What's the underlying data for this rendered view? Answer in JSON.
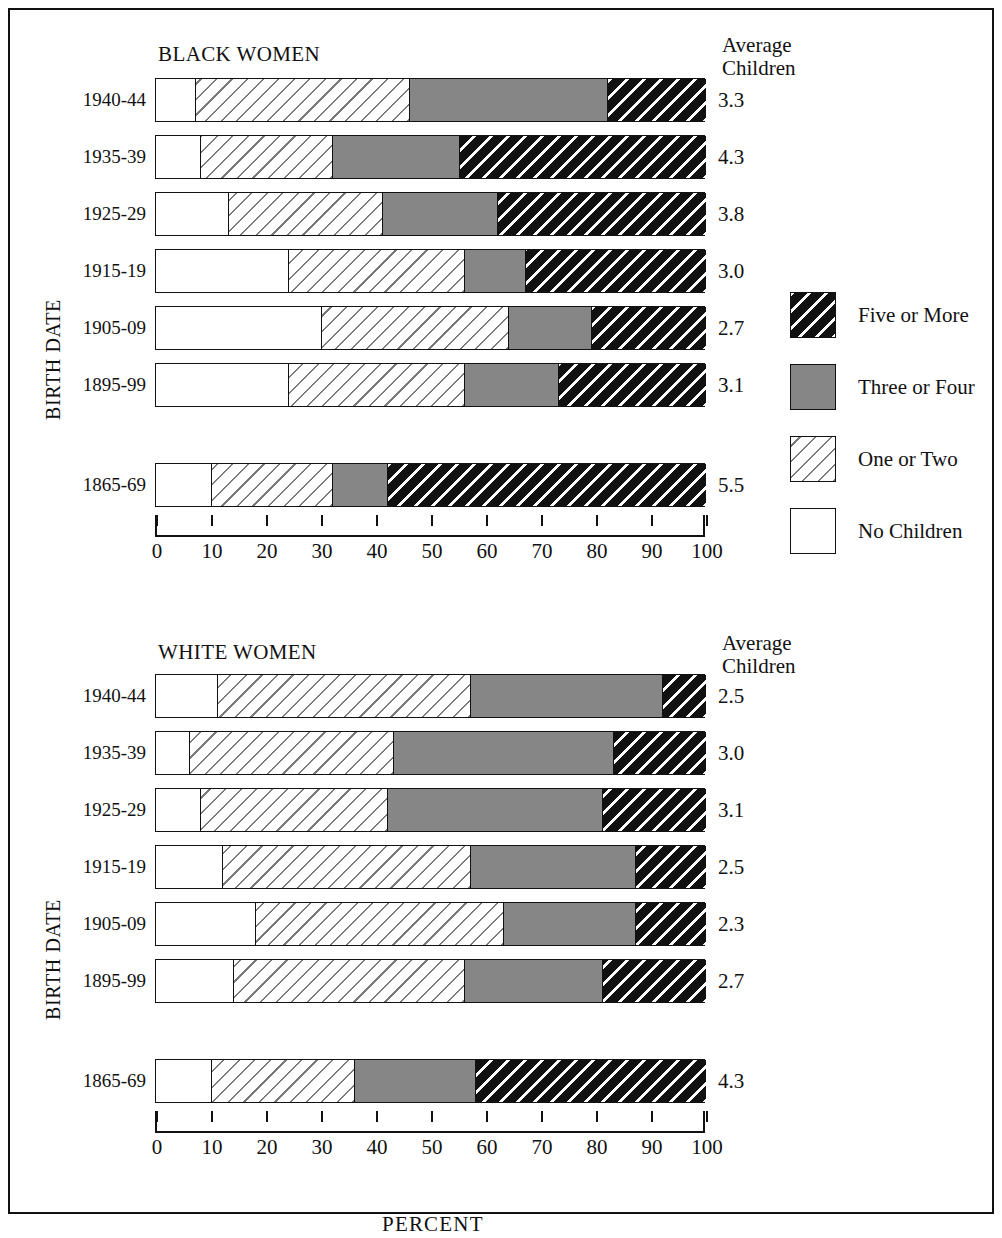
{
  "figure": {
    "axis_title": "PERCENT",
    "y_axis_title": "BIRTH DATE",
    "average_header_line1": "Average",
    "average_header_line2": "Children"
  },
  "legend": {
    "items": [
      {
        "key": "five",
        "label": "Five or More"
      },
      {
        "key": "threefour",
        "label": "Three or Four"
      },
      {
        "key": "onetwo",
        "label": "One or Two"
      },
      {
        "key": "none",
        "label": "No Children"
      }
    ]
  },
  "colors": {
    "five_or_more": "#111111",
    "three_or_four": "#868686",
    "one_or_two": "#ffffff",
    "no_children": "#ffffff",
    "outline": "#111111"
  },
  "chart_data": [
    {
      "type": "bar",
      "orientation": "horizontal",
      "stacked": true,
      "title": "BLACK WOMEN",
      "xlabel": "PERCENT",
      "ylabel": "BIRTH DATE",
      "xlim": [
        0,
        100
      ],
      "xticks": [
        0,
        10,
        20,
        30,
        40,
        50,
        60,
        70,
        80,
        90,
        100
      ],
      "grid": false,
      "legend_position": "right",
      "categories": [
        "1940-44",
        "1935-39",
        "1925-29",
        "1915-19",
        "1905-09",
        "1895-99",
        "1865-69"
      ],
      "series": [
        {
          "name": "No Children",
          "values": [
            7,
            8,
            13,
            24,
            30,
            24,
            10
          ]
        },
        {
          "name": "One or Two",
          "values": [
            39,
            24,
            28,
            32,
            34,
            32,
            22
          ]
        },
        {
          "name": "Three or Four",
          "values": [
            36,
            23,
            21,
            11,
            15,
            17,
            10
          ]
        },
        {
          "name": "Five or More",
          "values": [
            18,
            45,
            38,
            33,
            21,
            27,
            58
          ]
        }
      ],
      "annotations": {
        "header": "Average Children",
        "values": [
          "3.3",
          "4.3",
          "3.8",
          "3.0",
          "2.7",
          "3.1",
          "5.5"
        ]
      }
    },
    {
      "type": "bar",
      "orientation": "horizontal",
      "stacked": true,
      "title": "WHITE WOMEN",
      "xlabel": "PERCENT",
      "ylabel": "BIRTH DATE",
      "xlim": [
        0,
        100
      ],
      "xticks": [
        0,
        10,
        20,
        30,
        40,
        50,
        60,
        70,
        80,
        90,
        100
      ],
      "grid": false,
      "legend_position": "right",
      "categories": [
        "1940-44",
        "1935-39",
        "1925-29",
        "1915-19",
        "1905-09",
        "1895-99",
        "1865-69"
      ],
      "series": [
        {
          "name": "No Children",
          "values": [
            11,
            6,
            8,
            12,
            18,
            14,
            10
          ]
        },
        {
          "name": "One or Two",
          "values": [
            46,
            37,
            34,
            45,
            45,
            42,
            26
          ]
        },
        {
          "name": "Three or Four",
          "values": [
            35,
            40,
            39,
            30,
            24,
            25,
            22
          ]
        },
        {
          "name": "Five or More",
          "values": [
            8,
            17,
            19,
            13,
            13,
            19,
            42
          ]
        }
      ],
      "annotations": {
        "header": "Average Children",
        "values": [
          "2.5",
          "3.0",
          "3.1",
          "2.5",
          "2.3",
          "2.7",
          "4.3"
        ]
      }
    }
  ]
}
